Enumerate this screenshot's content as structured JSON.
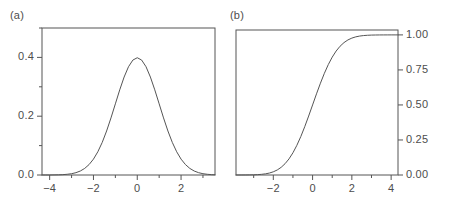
{
  "figure": {
    "width": 458,
    "height": 216,
    "background": "#ffffff",
    "ink": "#555555",
    "text_color": "#4d4d4d"
  },
  "panels": [
    {
      "id": "panel-a",
      "label": "(a)",
      "label_x": 10,
      "label_y": 9,
      "box": {
        "left": 42,
        "top": 28,
        "right": 215,
        "bottom": 175
      }
    },
    {
      "id": "panel-b",
      "label": "(b)",
      "label_x": 230,
      "label_y": 9,
      "box": {
        "left": 236,
        "top": 30,
        "right": 398,
        "bottom": 175
      }
    }
  ],
  "chart_data": [
    {
      "id": "panel-a",
      "type": "line",
      "title": "(a)",
      "subtitle": "",
      "xlabel": "",
      "ylabel": "",
      "xlim": [
        -4.35,
        3.55
      ],
      "ylim": [
        0.0,
        0.5
      ],
      "grid": false,
      "legend": "none",
      "function": "standard normal probability density",
      "x_major_ticks": [
        -4,
        -2,
        0,
        2
      ],
      "x_major_tick_labels": [
        "-4",
        "-2",
        "0",
        "2"
      ],
      "x_minor_ticks": [
        -3,
        -1,
        1,
        3
      ],
      "y_major_ticks": [
        0.0,
        0.2,
        0.4
      ],
      "y_major_tick_labels": [
        "0.0",
        "0.2",
        "0.4"
      ],
      "y_minor_ticks": [
        0.1,
        0.3,
        0.5
      ],
      "y_axis_side": "left",
      "x": [
        -4.35,
        -4.2,
        -4.0,
        -3.8,
        -3.6,
        -3.4,
        -3.2,
        -3.0,
        -2.8,
        -2.6,
        -2.4,
        -2.2,
        -2.0,
        -1.8,
        -1.6,
        -1.4,
        -1.2,
        -1.0,
        -0.8,
        -0.6,
        -0.4,
        -0.2,
        0.0,
        0.2,
        0.4,
        0.6,
        0.8,
        1.0,
        1.2,
        1.4,
        1.6,
        1.8,
        2.0,
        2.2,
        2.4,
        2.6,
        2.8,
        3.0,
        3.2,
        3.4,
        3.55
      ],
      "y": [
        0.0001,
        0.0001,
        0.0001,
        0.0003,
        0.0006,
        0.0012,
        0.0024,
        0.0044,
        0.0079,
        0.0136,
        0.0224,
        0.0355,
        0.054,
        0.079,
        0.1109,
        0.1497,
        0.1942,
        0.242,
        0.2897,
        0.3332,
        0.3683,
        0.391,
        0.3989,
        0.391,
        0.3683,
        0.3332,
        0.2897,
        0.242,
        0.1942,
        0.1497,
        0.1109,
        0.079,
        0.054,
        0.0355,
        0.0224,
        0.0136,
        0.0079,
        0.0044,
        0.0024,
        0.0012,
        0.0007
      ],
      "peak": {
        "x": 0.0,
        "y": 0.3989
      }
    },
    {
      "id": "panel-b",
      "type": "line",
      "title": "(b)",
      "subtitle": "",
      "xlabel": "",
      "ylabel": "",
      "xlim": [
        -3.9,
        4.35
      ],
      "ylim": [
        0.0,
        1.035
      ],
      "grid": false,
      "legend": "none",
      "function": "standard normal cumulative distribution",
      "x_major_ticks": [
        -2,
        0,
        2,
        4
      ],
      "x_major_tick_labels": [
        "-2",
        "0",
        "2",
        "4"
      ],
      "x_minor_ticks": [
        -3,
        -1,
        1,
        3
      ],
      "y_major_ticks": [
        0.0,
        0.25,
        0.5,
        0.75,
        1.0
      ],
      "y_major_tick_labels": [
        "0.00",
        "0.25",
        "0.50",
        "0.75",
        "1.00"
      ],
      "y_minor_ticks": [],
      "y_axis_side": "right",
      "x": [
        -3.9,
        -3.6,
        -3.4,
        -3.2,
        -3.0,
        -2.8,
        -2.6,
        -2.4,
        -2.2,
        -2.0,
        -1.8,
        -1.6,
        -1.4,
        -1.2,
        -1.0,
        -0.8,
        -0.6,
        -0.4,
        -0.2,
        0.0,
        0.2,
        0.4,
        0.6,
        0.8,
        1.0,
        1.2,
        1.4,
        1.6,
        1.8,
        2.0,
        2.2,
        2.4,
        2.6,
        2.8,
        3.0,
        3.2,
        3.4,
        3.6,
        3.8,
        4.0,
        4.2,
        4.35
      ],
      "y": [
        0.0,
        0.0002,
        0.0003,
        0.0007,
        0.0013,
        0.0026,
        0.0047,
        0.0082,
        0.0139,
        0.0228,
        0.0359,
        0.0548,
        0.0808,
        0.1151,
        0.1587,
        0.2119,
        0.2743,
        0.3446,
        0.4207,
        0.5,
        0.5793,
        0.6554,
        0.7257,
        0.7881,
        0.8413,
        0.8849,
        0.9192,
        0.9452,
        0.9641,
        0.9772,
        0.9861,
        0.9918,
        0.9953,
        0.9974,
        0.9987,
        0.9993,
        0.9997,
        0.9998,
        0.9999,
        1.0,
        1.0,
        1.0
      ]
    }
  ]
}
